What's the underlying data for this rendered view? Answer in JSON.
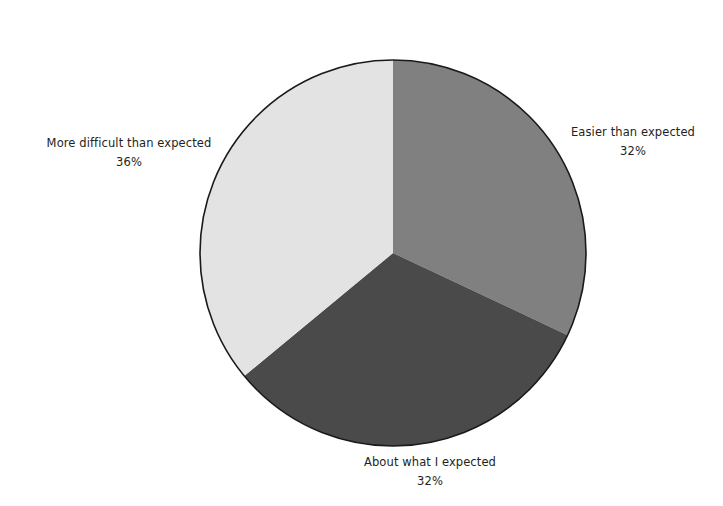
{
  "chart_data": {
    "type": "pie",
    "title": "",
    "subtitle": "",
    "xlabel": "",
    "ylabel": "",
    "legend_position": "none",
    "grid": false,
    "label_format": "name + percent",
    "start_angle_deg": 0,
    "direction": "clockwise",
    "center": {
      "x": 393,
      "y": 253
    },
    "radius": 193,
    "background_color": "#ffffff",
    "outline_color": "#1a1a1a",
    "text_color": "#231f20",
    "categories": [
      "Easier than expected",
      "About what I expected",
      "More difficult than expected"
    ],
    "values": [
      32,
      32,
      36
    ],
    "value_labels": [
      "32%",
      "32%",
      "36%"
    ],
    "colors": [
      "#808080",
      "#4a4a4a",
      "#e3e3e3"
    ],
    "slices": [
      {
        "label": "Easier than expected",
        "percent": 32,
        "percent_label": "32%",
        "color": "#808080",
        "start_angle_deg": 0,
        "end_angle_deg": 115.2
      },
      {
        "label": "About what I expected",
        "percent": 32,
        "percent_label": "32%",
        "color": "#4a4a4a",
        "start_angle_deg": 115.2,
        "end_angle_deg": 230.4
      },
      {
        "label": "More difficult than expected",
        "percent": 36,
        "percent_label": "36%",
        "color": "#e3e3e3",
        "start_angle_deg": 230.4,
        "end_angle_deg": 360
      }
    ]
  }
}
